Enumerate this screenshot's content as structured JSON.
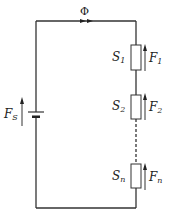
{
  "diagram": {
    "type": "magnetic-circuit",
    "flux_label": "Φ",
    "source": {
      "symbol": "F",
      "subscript": "S"
    },
    "elements": [
      {
        "reluctance": "S",
        "reluctance_sub": "1",
        "mmf": "F",
        "mmf_sub": "1"
      },
      {
        "reluctance": "S",
        "reluctance_sub": "2",
        "mmf": "F",
        "mmf_sub": "2"
      },
      {
        "reluctance": "S",
        "reluctance_sub": "n",
        "mmf": "F",
        "mmf_sub": "n"
      }
    ],
    "colors": {
      "line": "#333333",
      "background": "#ffffff"
    }
  }
}
